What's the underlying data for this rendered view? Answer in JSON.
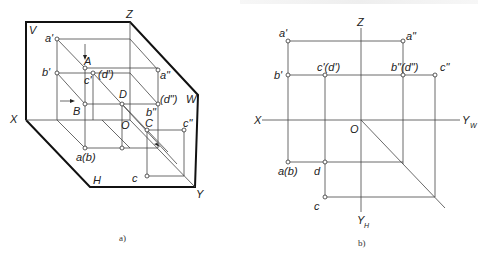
{
  "figure_a": {
    "caption": "a)",
    "planes": {
      "V": "V",
      "H": "H",
      "W": "W"
    },
    "axes": {
      "X": "X",
      "Y": "Y",
      "Z": "Z",
      "O": "O"
    },
    "points": {
      "a1": "a'",
      "A": "A",
      "b1": "b'",
      "c1": "c'",
      "d1": "(d')",
      "a2": "a\"",
      "B": "B",
      "D": "D",
      "b2": "b\"",
      "d2": "(d\")",
      "C": "C",
      "c2": "c\"",
      "ab": "a(b)",
      "c": "c"
    }
  },
  "figure_b": {
    "caption": "b)",
    "axes": {
      "X": "X",
      "Z": "Z",
      "O": "O",
      "YW": "Y",
      "YW_sub": "W",
      "YH": "Y",
      "YH_sub": "H"
    },
    "points": {
      "a1": "a'",
      "a2": "a\"",
      "b1": "b'",
      "cd1": "c'(d')",
      "bd2": "b\"(d\")",
      "c2": "c\"",
      "ab": "a(b)",
      "d": "d",
      "c": "c"
    }
  }
}
